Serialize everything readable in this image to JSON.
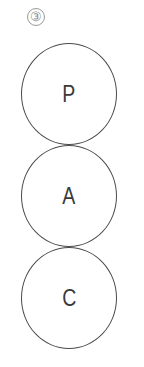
{
  "figure": {
    "label": "③"
  },
  "diagram": {
    "type": "stacked-circles",
    "nodes": [
      {
        "letter": "P"
      },
      {
        "letter": "A"
      },
      {
        "letter": "C"
      }
    ],
    "colors": {
      "stroke": "#4a4a4a",
      "text": "#3a3a3a",
      "label": "#8a8a8a",
      "background": "#ffffff"
    }
  }
}
